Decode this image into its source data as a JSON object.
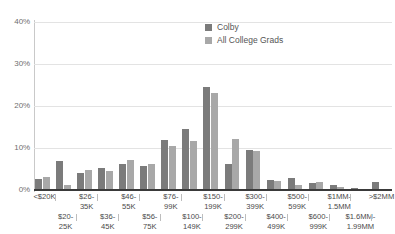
{
  "chart_data": {
    "type": "bar",
    "title": "",
    "subtitle": "",
    "xlabel": "",
    "ylabel": "",
    "ylim": [
      0,
      40
    ],
    "grid": true,
    "legend_position": "top-center-right",
    "ytick_labels": [
      "0%",
      "10%",
      "20%",
      "30%",
      "40%"
    ],
    "ytick_values": [
      0,
      10,
      20,
      30,
      40
    ],
    "categories": [
      "<$20K",
      "$20-\n25K",
      "$26-\n35K",
      "$36-\n45K",
      "$46-\n55K",
      "$56-\n75K",
      "$76-\n99K",
      "$100-\n149K",
      "$150-\n199K",
      "$200-\n299K",
      "$300-\n399K",
      "$400-\n499K",
      "$500-\n599K",
      "$600-\n999K",
      "$1MM-\n1.5MM",
      "$1.6MM-\n1.99MM",
      ">$2MM"
    ],
    "categories_flat": [
      "<$20K",
      "$20-25K",
      "$26-35K",
      "$36-45K",
      "$46-55K",
      "$56-75K",
      "$76-99K",
      "$100-149K",
      "$150-199K",
      "$200-299K",
      "$300-399K",
      "$400-499K",
      "$500-599K",
      "$600-999K",
      "$1MM-1.5MM",
      "$1.6MM-1.99MM",
      ">$2MM"
    ],
    "series": [
      {
        "name": "Colby",
        "color": "#7b7b7b",
        "values": [
          2.6,
          7.0,
          4.0,
          5.2,
          6.1,
          5.6,
          12.0,
          14.5,
          24.5,
          6.3,
          9.5,
          2.4,
          2.8,
          1.7,
          1.1,
          0.4,
          2.0
        ]
      },
      {
        "name": "All College Grads",
        "color": "#a8a8a8",
        "values": [
          3.0,
          1.3,
          4.8,
          4.6,
          7.1,
          6.3,
          10.4,
          11.7,
          23.0,
          12.2,
          9.3,
          2.1,
          1.2,
          2.0,
          0.6,
          0.3,
          0.0
        ]
      }
    ]
  },
  "legend": {
    "items": [
      {
        "label": "Colby"
      },
      {
        "label": "All College Grads"
      }
    ]
  }
}
